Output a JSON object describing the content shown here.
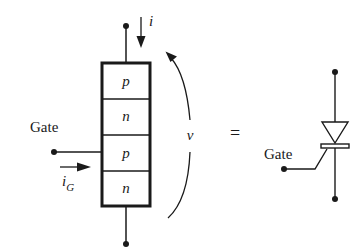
{
  "diagram": {
    "type": "thyristor-structure-and-symbol",
    "layers": [
      {
        "label": "p"
      },
      {
        "label": "n"
      },
      {
        "label": "p"
      },
      {
        "label": "n"
      }
    ],
    "current_label": "i",
    "gate_current_label": "i",
    "gate_current_subscript": "G",
    "voltage_label": "v",
    "gate_label_left": "Gate",
    "equals_sign": "=",
    "gate_label_symbol": "Gate"
  },
  "colors": {
    "ink": "#1a1a1a",
    "background": "#ffffff"
  }
}
